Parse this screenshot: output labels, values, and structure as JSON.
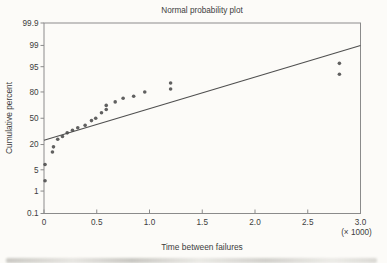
{
  "chart_data": {
    "type": "scatter",
    "title": "Normal probability plot",
    "xlabel": "Time between failures",
    "x_unit_label": "(× 1000)",
    "ylabel": "Cumulative percent",
    "y_scale": "normal-probability",
    "xlim": [
      0,
      3000
    ],
    "ylim": [
      0.1,
      99.9
    ],
    "x_tick_labels": [
      "0",
      "0.5",
      "1.0",
      "1.5",
      "2.0",
      "2.5",
      "3.0"
    ],
    "x_tick_values": [
      0,
      500,
      1000,
      1500,
      2000,
      2500,
      3000
    ],
    "y_tick_labels": [
      "99.9",
      "99",
      "95",
      "80",
      "50",
      "20",
      "5",
      "1",
      "0.1"
    ],
    "y_tick_values": [
      99.9,
      99,
      95,
      80,
      50,
      20,
      5,
      1,
      0.1
    ],
    "grid": false,
    "legend": "none",
    "points_time_percent": [
      [
        10,
        2.3
      ],
      [
        10,
        7
      ],
      [
        80,
        14
      ],
      [
        90,
        18
      ],
      [
        130,
        25
      ],
      [
        175,
        28
      ],
      [
        220,
        32
      ],
      [
        270,
        35
      ],
      [
        320,
        38
      ],
      [
        390,
        41
      ],
      [
        450,
        47
      ],
      [
        490,
        50
      ],
      [
        545,
        57
      ],
      [
        590,
        61
      ],
      [
        590,
        66
      ],
      [
        675,
        70
      ],
      [
        750,
        74
      ],
      [
        850,
        76
      ],
      [
        955,
        80
      ],
      [
        1200,
        82.5
      ],
      [
        1200,
        87
      ],
      [
        2800,
        92
      ],
      [
        2800,
        96
      ]
    ],
    "fit_line": {
      "from_time_percent": [
        0,
        24
      ],
      "to_time_percent": [
        3000,
        99
      ]
    },
    "colors": {
      "point": "#4a4a4a",
      "fit_line": "#4f4f4f",
      "axis": "#8b8b8b",
      "text": "#3d3d3d",
      "background": "#fcfbf8"
    }
  }
}
